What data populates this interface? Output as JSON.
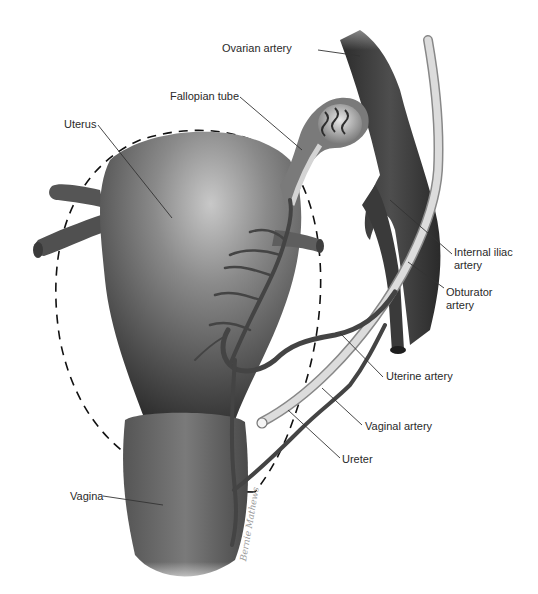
{
  "figure": {
    "labels": {
      "ovarian_artery": "Ovarian artery",
      "fallopian_tube": "Fallopian tube",
      "uterus": "Uterus",
      "internal_iliac_line1": "Internal iliac",
      "internal_iliac_line2": "artery",
      "obturator_line1": "Obturator",
      "obturator_line2": "artery",
      "uterine_artery": "Uterine artery",
      "vaginal_artery": "Vaginal artery",
      "ureter": "Ureter",
      "vagina": "Vagina"
    },
    "signature": "Bernie Mathews",
    "colors": {
      "organ_dark": "#3a3a3a",
      "organ_mid": "#6e6e6e",
      "organ_light": "#b5b5b5",
      "vessel": "#4a4a4a",
      "ureter": "#d8d8d8",
      "leader_line": "#333333",
      "dashed_outline": "#111111"
    }
  }
}
